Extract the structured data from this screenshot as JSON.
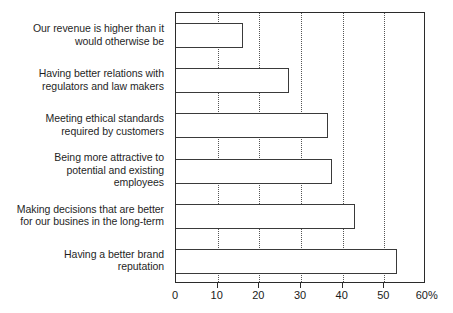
{
  "chart_data": {
    "type": "bar",
    "orientation": "horizontal",
    "title": "",
    "subtitle": "",
    "xlabel": "",
    "ylabel": "",
    "xlim": [
      0,
      60
    ],
    "grid": true,
    "grid_axis": "x",
    "grid_style": "dotted",
    "legend": false,
    "legend_position": "none",
    "axis_suffix": "%",
    "xticks": [
      0,
      10,
      20,
      30,
      40,
      50,
      60
    ],
    "xtick_labels": [
      "0",
      "10",
      "20",
      "30",
      "40",
      "50",
      "60%"
    ],
    "categories": [
      "Our revenue is higher than it would otherwise be",
      "Having better relations with regulators and law makers",
      "Meeting ethical standards required by customers",
      "Being more attractive to potential and existing employees",
      "Making decisions that are better for our busines in the long-term",
      "Having a better brand reputation"
    ],
    "category_lines": [
      [
        "Our revenue is higher than it",
        "would otherwise be"
      ],
      [
        "Having better relations with",
        "regulators and law makers"
      ],
      [
        "Meeting ethical standards",
        "required by customers"
      ],
      [
        "Being more attractive to",
        "potential and existing",
        "employees"
      ],
      [
        "Making decisions that are better",
        "for our busines in the long-term"
      ],
      [
        "Having a better brand",
        "reputation"
      ]
    ],
    "values": [
      16,
      27,
      36.5,
      37.5,
      43,
      53
    ],
    "colors": {
      "bar_fill": "#ffffff",
      "bar_stroke": "#3a3a3a",
      "axis": "#2b2b2b",
      "grid": "#555555",
      "text": "#1a1a1a",
      "background": "#ffffff"
    }
  }
}
